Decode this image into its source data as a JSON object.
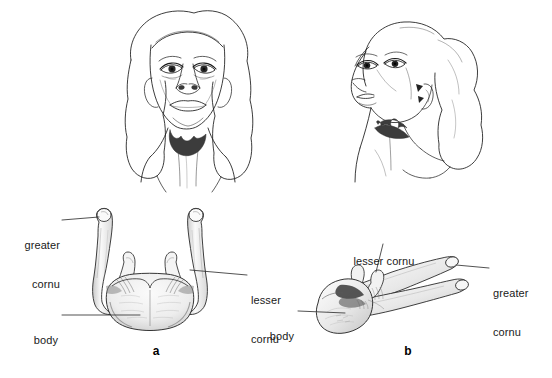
{
  "figure": {
    "type": "anatomical-illustration",
    "background_color": "#ffffff",
    "ink_color": "#1a1a1a",
    "bone_shade_color": "#9a9a9a",
    "silhouette_color": "#3c3c3c",
    "panels": [
      {
        "id": "a",
        "caption": "a",
        "view": "anterior",
        "head_description": "front view of head tilted back with hyoid bone silhouette under chin",
        "labels": [
          {
            "id": "greater-cornu-a",
            "line1": "greater",
            "line2": "cornu"
          },
          {
            "id": "lesser-cornu-a",
            "line1": "lesser",
            "line2": "cornu"
          },
          {
            "id": "body-a",
            "line1": "body",
            "line2": ""
          }
        ]
      },
      {
        "id": "b",
        "caption": "b",
        "view": "oblique",
        "head_description": "three-quarter view of head tilted back with hyoid bone silhouette at throat",
        "labels": [
          {
            "id": "lesser-cornu-b",
            "line1": "lesser cornu",
            "line2": ""
          },
          {
            "id": "greater-cornu-b",
            "line1": "greater",
            "line2": "cornu"
          },
          {
            "id": "body-b",
            "line1": "body",
            "line2": ""
          }
        ]
      }
    ]
  }
}
